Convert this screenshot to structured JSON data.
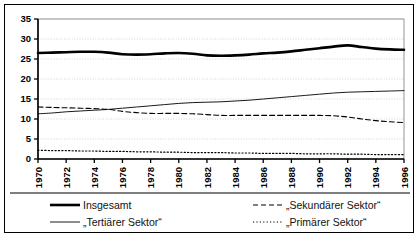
{
  "chart_data": {
    "type": "line",
    "title": "",
    "subtitle": "",
    "xlabel": "",
    "ylabel": "",
    "grid": true,
    "legend_position": "bottom",
    "xlim": [
      1970,
      1996
    ],
    "ylim": [
      0,
      35
    ],
    "yticks": [
      0,
      5,
      10,
      15,
      20,
      25,
      30,
      35
    ],
    "x": [
      1970,
      1971,
      1972,
      1973,
      1974,
      1975,
      1976,
      1977,
      1978,
      1979,
      1980,
      1981,
      1982,
      1983,
      1984,
      1985,
      1986,
      1987,
      1988,
      1989,
      1990,
      1991,
      1992,
      1993,
      1994,
      1995,
      1996
    ],
    "xticks": [
      1970,
      1972,
      1974,
      1976,
      1978,
      1980,
      1982,
      1984,
      1986,
      1988,
      1990,
      1992,
      1994,
      1996
    ],
    "xticklabels": [
      "1970",
      "1972",
      "1974",
      "1976",
      "1978",
      "1980",
      "1982",
      "1984",
      "1986",
      "1988",
      "1990",
      "1992",
      "1994",
      "1996"
    ],
    "series": [
      {
        "name": "Insgesamt",
        "style": "thick-solid",
        "color": "#000000",
        "values": [
          26.5,
          26.6,
          26.7,
          26.8,
          26.8,
          26.6,
          26.2,
          26.1,
          26.2,
          26.4,
          26.5,
          26.3,
          25.9,
          25.8,
          25.9,
          26.1,
          26.4,
          26.6,
          26.9,
          27.3,
          27.7,
          28.1,
          28.4,
          28.0,
          27.6,
          27.4,
          27.3
        ]
      },
      {
        "name": "„Tertiärer Sektor“",
        "style": "thin-solid",
        "color": "#000000",
        "values": [
          11.3,
          11.5,
          11.8,
          12.0,
          12.2,
          12.4,
          12.7,
          13.0,
          13.3,
          13.6,
          13.9,
          14.1,
          14.2,
          14.3,
          14.5,
          14.7,
          15.0,
          15.3,
          15.6,
          15.9,
          16.2,
          16.5,
          16.7,
          16.8,
          16.9,
          17.0,
          17.1
        ]
      },
      {
        "name": "„Sekundärer Sektor“",
        "style": "dashed",
        "color": "#000000",
        "values": [
          13.0,
          12.9,
          12.8,
          12.7,
          12.6,
          12.4,
          11.9,
          11.6,
          11.4,
          11.4,
          11.4,
          11.3,
          11.1,
          10.9,
          10.9,
          10.9,
          10.9,
          10.9,
          10.9,
          10.9,
          10.9,
          10.8,
          10.5,
          10.0,
          9.6,
          9.3,
          9.1
        ]
      },
      {
        "name": "„Primärer Sektor“",
        "style": "dotted",
        "color": "#000000",
        "values": [
          2.2,
          2.1,
          2.1,
          2.0,
          2.0,
          1.9,
          1.9,
          1.8,
          1.8,
          1.7,
          1.7,
          1.6,
          1.6,
          1.6,
          1.5,
          1.5,
          1.4,
          1.4,
          1.4,
          1.3,
          1.3,
          1.3,
          1.2,
          1.2,
          1.1,
          1.1,
          1.1
        ]
      }
    ]
  },
  "legend": {
    "items": [
      {
        "label": "Insgesamt",
        "style": "thick-solid"
      },
      {
        "label": "„Sekundärer Sektor“",
        "style": "dashed"
      },
      {
        "label": "„Tertiärer Sektor“",
        "style": "thin-solid"
      },
      {
        "label": "„Primärer Sektor“",
        "style": "dotted"
      }
    ]
  },
  "colors": {
    "line": "#000000",
    "grid": "#c8c8c8",
    "axis": "#000000",
    "border": "#000000",
    "background": "#ffffff"
  }
}
